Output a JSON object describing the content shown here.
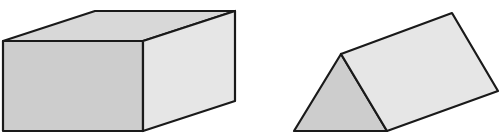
{
  "figure": {
    "colors": {
      "background": "#ffffff",
      "edge": "#1a1a1a",
      "front_face": "#cdcdcd",
      "top_face": "#d8d8d8",
      "side_face": "#e6e6e6"
    },
    "shapes": [
      {
        "name": "Rectangular prism",
        "faces": {
          "front": [
            [
              3,
              41
            ],
            [
              143,
              41
            ],
            [
              143,
              131
            ],
            [
              3,
              131
            ]
          ],
          "top": [
            [
              3,
              41
            ],
            [
              95,
              11
            ],
            [
              235,
              11
            ],
            [
              143,
              41
            ]
          ],
          "side": [
            [
              143,
              41
            ],
            [
              235,
              11
            ],
            [
              235,
              101
            ],
            [
              143,
              131
            ]
          ]
        }
      },
      {
        "name": "Triangular prism",
        "faces": {
          "front": [
            [
              341,
              54
            ],
            [
              294,
              131
            ],
            [
              387,
              131
            ]
          ],
          "side": [
            [
              341,
              54
            ],
            [
              452,
              13
            ],
            [
              498,
              91
            ],
            [
              387,
              131
            ]
          ]
        }
      }
    ]
  }
}
